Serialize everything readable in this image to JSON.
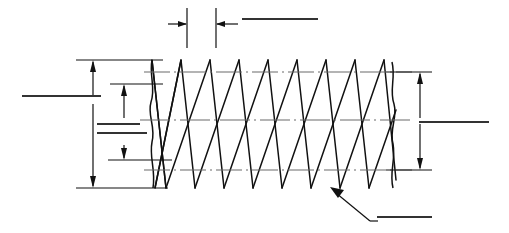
{
  "drawing": {
    "title": "Screw Thread Profile Dimension Drawing",
    "type": "engineering-line-drawing",
    "background_color": "#ffffff",
    "line_color": "#111111",
    "centerline_color": "#6b6b6b",
    "canvas": {
      "width": 509,
      "height": 233
    },
    "thread": {
      "description": "External (male) screw thread shown in longitudinal profile with V-form helical flanks",
      "crest_y": 60,
      "root_y": 188,
      "major_dia_line_y": 72,
      "minor_dia_line_y": 170,
      "axis_centerline_y": 120,
      "left_break_x": 152,
      "right_break_x": 396,
      "peak_count": 8,
      "pitch_px": 29,
      "helix_skew_px": 14
    },
    "dimensions": {
      "pitch": {
        "name": "pitch-dimension",
        "orientation": "horizontal",
        "extension_line_1_x": 187,
        "extension_line_2_x": 216,
        "arrow_y": 24,
        "label_value": "",
        "label_rule": true
      },
      "major_diameter": {
        "name": "major-diameter-dimension",
        "orientation": "vertical",
        "line_x": 93,
        "top_y": 60,
        "bottom_y": 188,
        "label_value": "",
        "label_rule": true
      },
      "thread_depth": {
        "name": "thread-depth-dimension",
        "orientation": "vertical",
        "line_x": 124,
        "top_y": 84,
        "bottom_y": 160,
        "label_value": "",
        "label_rule": true
      },
      "minor_diameter": {
        "name": "minor-diameter-dimension",
        "orientation": "vertical",
        "line_x": 420,
        "top_y": 72,
        "bottom_y": 170,
        "label_value": "",
        "label_rule": true
      },
      "root_callout": {
        "name": "thread-root-leader",
        "arrow_tip_x": 330,
        "arrow_tip_y": 187,
        "elbow_x": 370,
        "elbow_y": 221,
        "label_value": "",
        "label_rule": true
      }
    },
    "label_rules": [
      {
        "id": "pitch-label-rule",
        "x1": 242,
        "y": 19,
        "x2": 318
      },
      {
        "id": "major-dia-label-rule",
        "x1": 22,
        "y": 96,
        "x2": 101
      },
      {
        "id": "thread-depth-label-rule-1",
        "x1": 97,
        "y": 124,
        "x2": 140
      },
      {
        "id": "thread-depth-label-rule-2",
        "x1": 97,
        "y": 133,
        "x2": 147
      },
      {
        "id": "minor-dia-label-rule",
        "x1": 419,
        "y": 122,
        "x2": 489
      },
      {
        "id": "root-callout-label-rule",
        "x1": 377,
        "y": 217,
        "x2": 432
      }
    ]
  }
}
